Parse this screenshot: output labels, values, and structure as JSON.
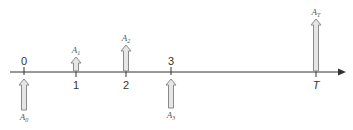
{
  "diagram": {
    "type": "cash-flow-timeline",
    "axis": {
      "color": "#333333",
      "arrow_end": true
    },
    "ticks": [
      {
        "label": "0",
        "x": 24,
        "label_pos": "above"
      },
      {
        "label": "1",
        "x": 76,
        "label_pos": "below"
      },
      {
        "label": "2",
        "x": 126,
        "label_pos": "below"
      },
      {
        "label": "3",
        "x": 171,
        "label_pos": "above"
      },
      {
        "label": "T",
        "x": 316,
        "label_pos": "below",
        "italic": true
      }
    ],
    "flows": [
      {
        "name": "A",
        "sub": "0",
        "x": 24,
        "direction": "up",
        "side": "below",
        "length": 31
      },
      {
        "name": "A",
        "sub": "1",
        "x": 76,
        "direction": "up",
        "side": "above",
        "length": 14
      },
      {
        "name": "A",
        "sub": "2",
        "x": 126,
        "direction": "up",
        "side": "above",
        "length": 26
      },
      {
        "name": "A",
        "sub": "3",
        "x": 171,
        "direction": "up",
        "side": "below",
        "length": 29
      },
      {
        "name": "A",
        "sub": "T",
        "x": 316,
        "direction": "up",
        "side": "above",
        "length": 52
      }
    ],
    "colors": {
      "arrow_fill": "#e6e6e6",
      "arrow_stroke": "#8a8a8a",
      "axis": "#333333"
    }
  }
}
